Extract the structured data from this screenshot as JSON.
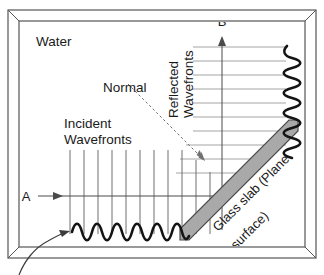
{
  "figure": {
    "medium_label": "Water",
    "labels": {
      "normal": "Normal",
      "incident_line1": "Incident",
      "incident_line2": "Wavefronts",
      "reflected_line1": "Reflected",
      "reflected_line2": "Wavefronts",
      "slab_line1": "Glass slab (Plane",
      "slab_line2": "surface)",
      "ray_in": "A",
      "ray_out": "B"
    },
    "colors": {
      "stroke": "#3c3c3c",
      "wavefront_incident": "#6e6e6e",
      "wavefront_reflected": "#9a9a9a",
      "slab_fill": "#a9a9a9",
      "slab_stroke": "#4a4a4a",
      "wave_stroke": "#1a1a1a",
      "frame_stroke": "#555555",
      "normal_dash": "#707070",
      "background": "#ffffff"
    },
    "geometry": {
      "frame_outer": {
        "x": 8,
        "y": 10,
        "width": 308,
        "height": 248
      },
      "frame_inner": {
        "x": 18,
        "y": 20,
        "width": 288,
        "height": 228
      },
      "incident_wavefronts": {
        "count": 11,
        "x_start": 70,
        "x_spacing": 14,
        "y_top": 150,
        "y_bottom": 234
      },
      "reflected_wavefronts": {
        "count": 9,
        "y_start": 47,
        "y_spacing": 14,
        "x_right": 286
      },
      "incident_ray": {
        "x1": 38,
        "y1": 196,
        "x2": 233,
        "y2": 196,
        "label_x": 26,
        "label_y": 200
      },
      "reflected_ray": {
        "x1": 222,
        "y1": 228,
        "x2": 222,
        "y2": 38,
        "label_x": 222,
        "label_y": 25
      },
      "normal_line": {
        "x1": 128,
        "y1": 84,
        "x2": 205,
        "y2": 161
      },
      "slab": {
        "x1": 178,
        "y1": 238,
        "x2": 290,
        "y2": 126,
        "thickness": 13
      },
      "wave_horizontal": {
        "x_start": 72,
        "x_end": 188,
        "y": 232,
        "cycles": 9,
        "amplitude": 8
      },
      "wave_vertical": {
        "y_start": 44,
        "y_end": 158,
        "x": 292,
        "cycles": 9,
        "amplitude": 8
      },
      "pointer_arrow": {
        "x_start": 18,
        "y_start": 275,
        "x_end": 68,
        "y_end": 230
      }
    }
  }
}
